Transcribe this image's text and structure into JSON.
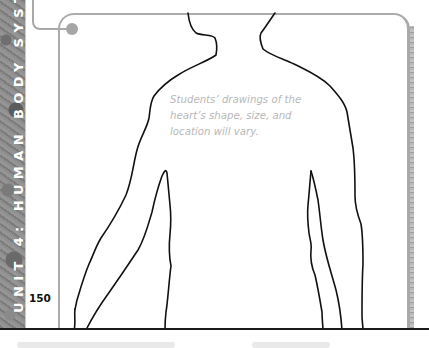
{
  "sidebar": {
    "unit_label": "UNIT 4: HUMAN BODY SYSTE",
    "background": "granite-texture",
    "text_color": "#ffffff"
  },
  "page": {
    "number": "150"
  },
  "figure": {
    "caption_lines": [
      "Students’ drawings of the",
      "heart’s shape, size, and",
      "location will vary."
    ],
    "caption_color": "#b8b8b8",
    "outline_color": "#111111",
    "frame_color": "#acacac"
  }
}
